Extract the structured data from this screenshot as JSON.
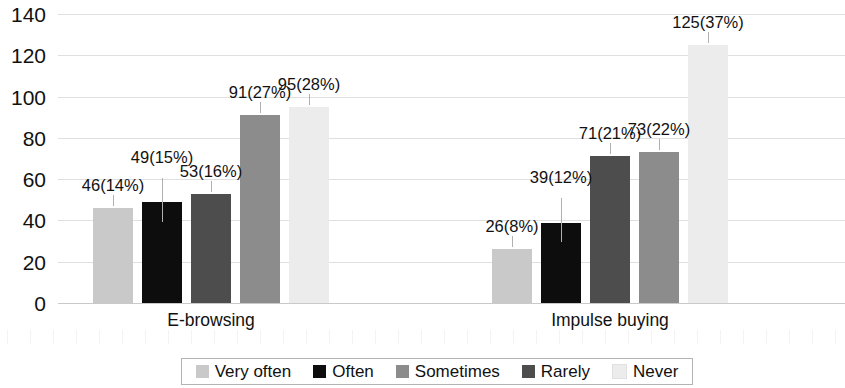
{
  "chart_data": {
    "type": "bar",
    "title": "",
    "subtitle": "",
    "xlabel": "",
    "ylabel": "",
    "categories": [
      "E-browsing",
      "Impulse buying"
    ],
    "ylim": [
      0,
      140
    ],
    "ytick_values": [
      140,
      120,
      100,
      80,
      60,
      40,
      20,
      0
    ],
    "ytick_labels": [
      "140",
      "120",
      "100",
      "80",
      "60",
      "40",
      "20",
      "0"
    ],
    "grid": true,
    "legend_position": "bottom",
    "series": [
      {
        "name": "Very often",
        "color": "#c9c9c9",
        "values": [
          46,
          26
        ],
        "labels": [
          "46(14%)",
          "26(8%)"
        ],
        "percents": [
          "14%",
          "8%"
        ]
      },
      {
        "name": "Often",
        "color": "#0d0d0d",
        "values": [
          49,
          39
        ],
        "labels": [
          "49(15%)",
          "39(12%)"
        ],
        "percents": [
          "15%",
          "12%"
        ]
      },
      {
        "name": "Sometimes",
        "color": "#4d4d4d",
        "values": [
          53,
          71
        ],
        "labels": [
          "53(16%)",
          "71(21%)"
        ],
        "percents": [
          "16%",
          "21%"
        ]
      },
      {
        "name": "Rarely",
        "color": "#8c8c8c",
        "values": [
          91,
          73
        ],
        "labels": [
          "91(27%)",
          "73(22%)"
        ],
        "percents": [
          "27%",
          "22%"
        ]
      },
      {
        "name": "Never",
        "color": "#ececec",
        "values": [
          95,
          125
        ],
        "labels": [
          "95(28%)",
          "125(37%)"
        ],
        "percents": [
          "28%",
          "37%"
        ]
      }
    ]
  },
  "legend": {
    "items": [
      {
        "label": "Very often",
        "color": "#c9c9c9"
      },
      {
        "label": "Often",
        "color": "#0d0d0d"
      },
      {
        "label": "Sometimes",
        "color": "#8c8c8c"
      },
      {
        "label": "Rarely",
        "color": "#4d4d4d"
      },
      {
        "label": "Never",
        "color": "#ececec"
      }
    ]
  },
  "axes": {
    "y_ticks": [
      "140",
      "120",
      "100",
      "80",
      "60",
      "40",
      "20",
      "0"
    ],
    "x_labels": [
      "E-browsing",
      "Impulse buying"
    ]
  }
}
